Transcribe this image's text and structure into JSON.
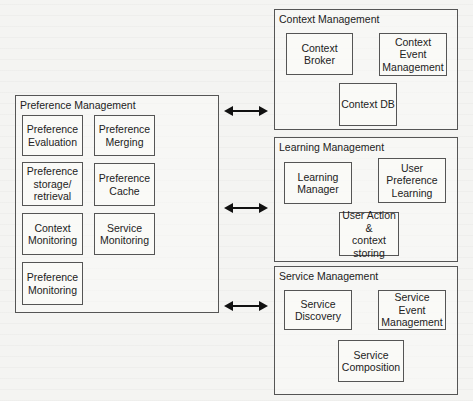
{
  "diagram": {
    "preference_management": {
      "title": "Preference Management",
      "components": [
        {
          "label": "Preference\nEvaluation"
        },
        {
          "label": "Preference\nMerging"
        },
        {
          "label": "Preference\nstorage/\nretrieval"
        },
        {
          "label": "Preference\nCache"
        },
        {
          "label": "Context\nMonitoring"
        },
        {
          "label": "Service\nMonitoring"
        },
        {
          "label": "Preference\nMonitoring"
        }
      ]
    },
    "context_management": {
      "title": "Context Management",
      "components": [
        {
          "label": "Context\nBroker"
        },
        {
          "label": "Context Event\nManagement"
        },
        {
          "label": "Context DB"
        }
      ]
    },
    "learning_management": {
      "title": "Learning Management",
      "components": [
        {
          "label": "Learning\nManager"
        },
        {
          "label": "User\nPreference\nLearning"
        },
        {
          "label": "User Action &\ncontext\nstoring"
        }
      ]
    },
    "service_management": {
      "title": "Service Management",
      "components": [
        {
          "label": "Service\nDiscovery"
        },
        {
          "label": "Service Event\nManagement"
        },
        {
          "label": "Service\nComposition"
        }
      ]
    },
    "connections": [
      {
        "from": "Preference Management",
        "to": "Context Management",
        "type": "bidirectional"
      },
      {
        "from": "Preference Management",
        "to": "Learning Management",
        "type": "bidirectional"
      },
      {
        "from": "Preference Management",
        "to": "Service Management",
        "type": "bidirectional"
      }
    ]
  }
}
